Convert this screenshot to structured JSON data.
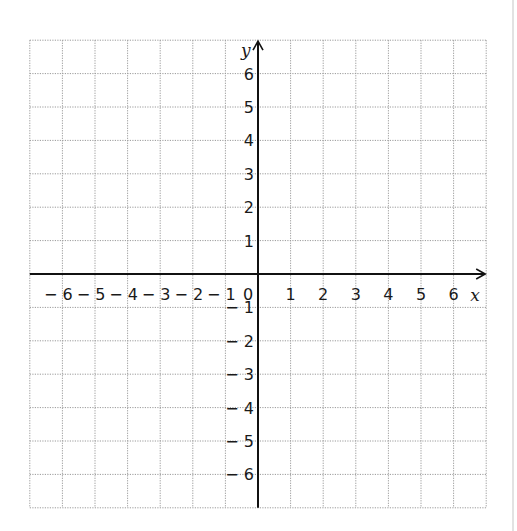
{
  "chart_data": {
    "type": "scatter",
    "title": "",
    "xlabel": "x",
    "ylabel": "y",
    "xlim": [
      -7,
      7
    ],
    "ylim": [
      -7,
      7
    ],
    "grid": true,
    "grid_style": "dotted",
    "x_ticks": [
      -6,
      -5,
      -4,
      -3,
      -2,
      -1,
      0,
      1,
      2,
      3,
      4,
      5,
      6
    ],
    "x_tick_labels": [
      "− 6",
      "− 5",
      "− 4",
      "− 3",
      "− 2",
      "− 1",
      "0",
      "1",
      "2",
      "3",
      "4",
      "5",
      "6"
    ],
    "y_ticks": [
      6,
      5,
      4,
      3,
      2,
      1,
      -1,
      -2,
      -3,
      -4,
      -5,
      -6
    ],
    "y_tick_labels": [
      "6",
      "5",
      "4",
      "3",
      "2",
      "1",
      "− 1",
      "− 2",
      "− 3",
      "− 4",
      "− 5",
      "− 6"
    ],
    "series": [],
    "colors": {
      "axis": "#111111",
      "grid": "#9a9a9a",
      "text": "#1a1a1a"
    }
  }
}
